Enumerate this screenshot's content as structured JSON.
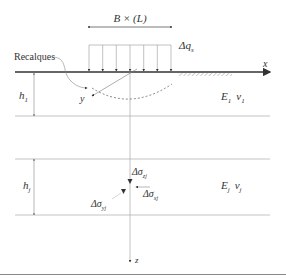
{
  "diagram": {
    "type": "geotechnical-settlement-schematic",
    "footing_dimension_label": "B × (L)",
    "load_label": {
      "base": "Δq",
      "sub": "s"
    },
    "settlement_label": "Recalques",
    "axes": {
      "x": "x",
      "y": "y",
      "z": "z"
    },
    "layers": [
      {
        "thickness_label": {
          "base": "h",
          "sub": "1"
        },
        "modulus_label": {
          "base": "E",
          "sub": "1"
        },
        "poisson_label": {
          "base": "ν",
          "sub": "1"
        }
      },
      {
        "thickness_label": {
          "base": "h",
          "sub": "j"
        },
        "modulus_label": {
          "base": "E",
          "sub": "j"
        },
        "poisson_label": {
          "base": "ν",
          "sub": "j"
        }
      }
    ],
    "stresses": {
      "vertical": {
        "base": "Δσ",
        "sub": "zj"
      },
      "horizontal_x": {
        "base": "Δσ",
        "sub": "xj"
      },
      "horizontal_y": {
        "base": "Δσ",
        "sub": "yj"
      }
    },
    "colors": {
      "line": "#555555",
      "thin_line": "#999999",
      "text": "#333333",
      "background": "#ffffff"
    }
  }
}
